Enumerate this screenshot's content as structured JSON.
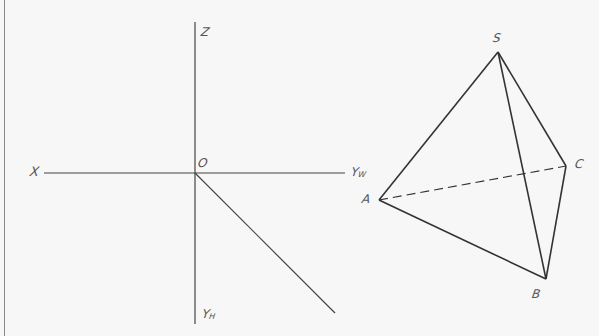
{
  "diagram": {
    "title": "",
    "axes": {
      "labels": {
        "x": "X",
        "z": "Z",
        "origin": "O",
        "yw": "YW",
        "yh": "YH"
      },
      "origin": [
        195,
        173
      ],
      "x_axis": [
        [
          44,
          173
        ],
        [
          345,
          173
        ]
      ],
      "z_axis": [
        [
          195,
          22
        ],
        [
          195,
          324
        ]
      ],
      "yh_axis": [
        [
          195,
          173
        ],
        [
          335,
          313
        ]
      ]
    },
    "tetrahedron": {
      "vertices": {
        "S": [
          498,
          52
        ],
        "A": [
          379,
          200
        ],
        "B": [
          546,
          279
        ],
        "C": [
          566,
          166
        ]
      },
      "solid_edges": [
        [
          "S",
          "A"
        ],
        [
          "S",
          "B"
        ],
        [
          "S",
          "C"
        ],
        [
          "A",
          "B"
        ],
        [
          "B",
          "C"
        ]
      ],
      "hidden_edges": [
        [
          "A",
          "C"
        ]
      ],
      "labels": {
        "S": "S",
        "A": "A",
        "B": "B",
        "C": "C"
      }
    },
    "colors": {
      "axis": "#444444",
      "edge": "#333333",
      "label": "#555555",
      "border": "#888888"
    }
  }
}
